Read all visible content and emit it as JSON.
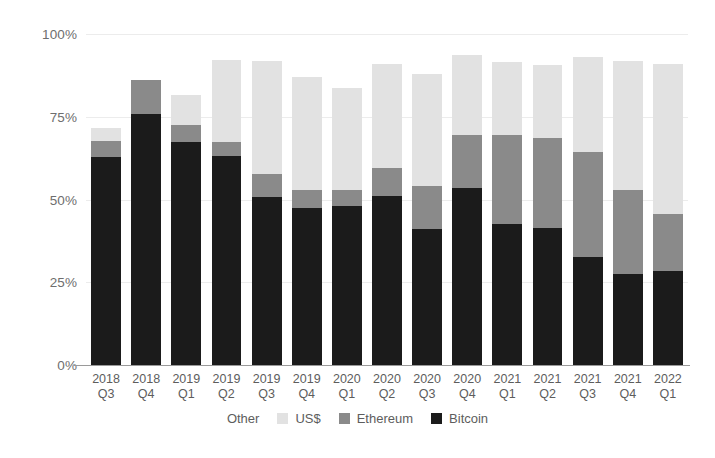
{
  "chart_data": {
    "type": "bar",
    "stacked": true,
    "title": "",
    "subtitle": "",
    "xlabel": "",
    "ylabel": "",
    "ylim": [
      0,
      100
    ],
    "yticks": [
      "0%",
      "25%",
      "50%",
      "75%",
      "100%"
    ],
    "ytick_values": [
      0,
      25,
      50,
      75,
      100
    ],
    "grid": true,
    "legend_position": "bottom",
    "categories": [
      "2018 Q3",
      "2018 Q4",
      "2019 Q1",
      "2019 Q2",
      "2019 Q3",
      "2019 Q4",
      "2020 Q1",
      "2020 Q2",
      "2020 Q3",
      "2020 Q4",
      "2021 Q1",
      "2021 Q2",
      "2021 Q3",
      "2021 Q4",
      "2022 Q1"
    ],
    "categories_split": [
      {
        "year": "2018",
        "quarter": "Q3"
      },
      {
        "year": "2018",
        "quarter": "Q4"
      },
      {
        "year": "2019",
        "quarter": "Q1"
      },
      {
        "year": "2019",
        "quarter": "Q2"
      },
      {
        "year": "2019",
        "quarter": "Q3"
      },
      {
        "year": "2019",
        "quarter": "Q4"
      },
      {
        "year": "2020",
        "quarter": "Q1"
      },
      {
        "year": "2020",
        "quarter": "Q2"
      },
      {
        "year": "2020",
        "quarter": "Q3"
      },
      {
        "year": "2020",
        "quarter": "Q4"
      },
      {
        "year": "2021",
        "quarter": "Q1"
      },
      {
        "year": "2021",
        "quarter": "Q2"
      },
      {
        "year": "2021",
        "quarter": "Q3"
      },
      {
        "year": "2021",
        "quarter": "Q4"
      },
      {
        "year": "2022",
        "quarter": "Q1"
      }
    ],
    "series": [
      {
        "name": "Bitcoin",
        "color": "#1b1b1b",
        "values": [
          62.8,
          75.8,
          67.4,
          63.0,
          50.8,
          47.5,
          48.0,
          51.0,
          41.0,
          53.5,
          42.5,
          41.5,
          32.5,
          27.5,
          28.5
        ]
      },
      {
        "name": "Ethereum",
        "color": "#8a8a8a",
        "values": [
          5.0,
          10.2,
          5.1,
          4.5,
          7.0,
          5.5,
          5.0,
          8.5,
          13.0,
          16.0,
          27.0,
          27.0,
          32.0,
          25.5,
          17.0
        ]
      },
      {
        "name": "US$",
        "color": "#e2e2e2",
        "values": [
          3.8,
          0.0,
          9.0,
          24.5,
          34.2,
          34.0,
          30.7,
          31.5,
          34.0,
          24.1,
          22.0,
          22.0,
          28.5,
          39.0,
          45.5
        ]
      },
      {
        "name": "Other",
        "color": "#f4f4f4",
        "values": [
          0.0,
          0.0,
          0.0,
          0.0,
          0.0,
          0.0,
          0.0,
          0.0,
          0.0,
          0.0,
          0.0,
          0.0,
          0.0,
          0.0,
          0.0
        ]
      }
    ],
    "totals": [
      71.6,
      86.0,
      81.5,
      92.0,
      92.0,
      87.0,
      83.7,
      91.0,
      88.0,
      93.6,
      91.5,
      90.5,
      93.0,
      92.0,
      91.0
    ]
  },
  "legend": {
    "items": [
      {
        "label": "Other",
        "swatch": "sw-other",
        "icon": "legend-swatch-other-icon"
      },
      {
        "label": "US$",
        "swatch": "sw-uss",
        "icon": "legend-swatch-uss-icon"
      },
      {
        "label": "Ethereum",
        "swatch": "sw-ethereum",
        "icon": "legend-swatch-ethereum-icon"
      },
      {
        "label": "Bitcoin",
        "swatch": "sw-bitcoin",
        "icon": "legend-swatch-bitcoin-icon"
      }
    ]
  },
  "colors": {
    "bitcoin": "#1b1b1b",
    "ethereum": "#8a8a8a",
    "uss": "#e2e2e2",
    "other": "#f4f4f4",
    "grid": "#ececec",
    "axis": "#9a9a9a",
    "text": "#5d5d5d",
    "background": "#ffffff"
  }
}
